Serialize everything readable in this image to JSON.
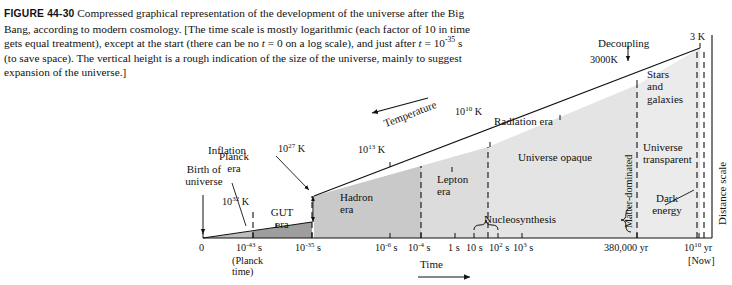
{
  "figure": {
    "number": "FIGURE 44-30",
    "caption_parts": {
      "p1": "Compressed graphical representation of the development of the universe after the Big Bang, according to modern cosmology. [The time scale is mostly logarithmic (each factor of 10 in time gets equal treatment), except at the start (there can be no ",
      "t0": "t",
      "p2": " = 0 on a log scale), and just after ",
      "t1": "t",
      "p3": " = 10",
      "exp": "-35",
      "p4": " s (to save space). The vertical height is a rough indication of the size of the universe, mainly to suggest expansion of the universe.]"
    }
  },
  "axes": {
    "x_title": "Time",
    "x_arrow": "⟶",
    "temperature_title": "Temperature",
    "distance_title": "Distance scale",
    "origin_label": "0"
  },
  "x_ticks": [
    {
      "label": "0",
      "sup": "",
      "unit": "",
      "x": 203
    },
    {
      "label": "10",
      "sup": "-43",
      "unit": " s",
      "x": 253
    },
    {
      "label": "10",
      "sup": "-35",
      "unit": " s",
      "x": 312
    },
    {
      "label": "10",
      "sup": "-6",
      "unit": " s",
      "x": 390
    },
    {
      "label": "10",
      "sup": "-4",
      "unit": " s",
      "x": 421
    },
    {
      "label": "1",
      "sup": "",
      "unit": " s",
      "x": 455
    },
    {
      "label": "10",
      "sup": "",
      "unit": " s",
      "x": 474
    },
    {
      "label": "10",
      "sup": "2",
      "unit": " s",
      "x": 498
    },
    {
      "label": "10",
      "sup": "3",
      "unit": " s",
      "x": 522
    },
    {
      "label": "380,000 yr",
      "sup": "",
      "unit": "",
      "x": 637
    },
    {
      "label": "10",
      "sup": "10",
      "unit": " yr",
      "x": 699
    }
  ],
  "planck_note": {
    "line1": "(Planck",
    "line2": "time)"
  },
  "now_note": "[Now]",
  "temperature_ticks": [
    {
      "label": "10",
      "sup": "32",
      "unit": " K"
    },
    {
      "label": "10",
      "sup": "27",
      "unit": " K"
    },
    {
      "label": "10",
      "sup": "13",
      "unit": " K"
    },
    {
      "label": "10",
      "sup": "10",
      "unit": " K"
    },
    {
      "label": "3000K",
      "sup": "",
      "unit": ""
    },
    {
      "label": "3 K",
      "sup": "",
      "unit": ""
    }
  ],
  "annotations": {
    "birth": {
      "line1": "Birth of",
      "line2": "universe"
    },
    "planck_era": {
      "line1": "Planck",
      "line2": "era"
    },
    "inflation": "Inflation",
    "gut_era": {
      "line1": "GUT",
      "line2": "era"
    },
    "hadron_era": {
      "line1": "Hadron",
      "line2": "era"
    },
    "lepton_era": {
      "line1": "Lepton",
      "line2": "era"
    },
    "radiation_era": "Radiation era",
    "universe_opaque": "Universe opaque",
    "nucleosynthesis": "Nucleosynthesis",
    "decoupling": "Decoupling",
    "stars_galaxies": {
      "line1": "Stars",
      "line2": "and",
      "line3": "galaxies"
    },
    "universe_transparent": {
      "line1": "Universe",
      "line2": "transparent"
    },
    "matter_dominated": "Matter-dominated",
    "dark_energy": {
      "line1": "Dark",
      "line2": "energy"
    }
  },
  "colors": {
    "ink": "#111111",
    "gut_fill": "#9e9e9e",
    "hadron_fill": "#c9c9c9",
    "lepton_fill": "#dcdcdc",
    "radiation_fill": "#e4e4e4",
    "matter_fill": "#e9e9e9",
    "background": "#ffffff"
  }
}
